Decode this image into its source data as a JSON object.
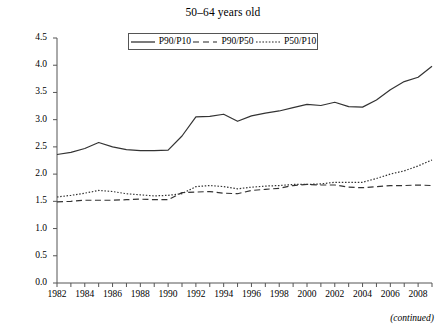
{
  "chart_data": {
    "type": "line",
    "title": "50–64 years old",
    "xlabel": "",
    "ylabel": "",
    "xlim": [
      1982,
      2009
    ],
    "ylim": [
      0.0,
      4.5
    ],
    "grid": false,
    "legend_position": "top-center",
    "y_ticks": [
      "0.0",
      "0.5",
      "1.0",
      "1.5",
      "2.0",
      "2.5",
      "3.0",
      "3.5",
      "4.0",
      "4.5"
    ],
    "x_ticks": [
      "1982",
      "1984",
      "1986",
      "1988",
      "1990",
      "1992",
      "1994",
      "1996",
      "1998",
      "2000",
      "2002",
      "2004",
      "2006",
      "2008"
    ],
    "x": [
      1982,
      1983,
      1984,
      1985,
      1986,
      1987,
      1988,
      1989,
      1990,
      1991,
      1992,
      1993,
      1994,
      1995,
      1996,
      1997,
      1998,
      1999,
      2000,
      2001,
      2002,
      2003,
      2004,
      2005,
      2006,
      2007,
      2008,
      2009
    ],
    "series": [
      {
        "name": "P90/P10",
        "style": "solid",
        "color": "#333333",
        "values": [
          2.36,
          2.4,
          2.47,
          2.58,
          2.5,
          2.45,
          2.43,
          2.43,
          2.44,
          2.7,
          3.05,
          3.06,
          3.1,
          2.97,
          3.07,
          3.12,
          3.16,
          3.22,
          3.28,
          3.26,
          3.32,
          3.24,
          3.23,
          3.36,
          3.55,
          3.7,
          3.78,
          3.98
        ]
      },
      {
        "name": "P90/P50",
        "style": "dashed",
        "color": "#333333",
        "values": [
          1.49,
          1.5,
          1.52,
          1.52,
          1.52,
          1.53,
          1.54,
          1.53,
          1.53,
          1.66,
          1.67,
          1.68,
          1.65,
          1.64,
          1.7,
          1.72,
          1.74,
          1.79,
          1.81,
          1.8,
          1.8,
          1.76,
          1.75,
          1.77,
          1.79,
          1.79,
          1.8,
          1.79
        ]
      },
      {
        "name": "P50/P10",
        "style": "dotted",
        "color": "#333333",
        "values": [
          1.58,
          1.61,
          1.65,
          1.7,
          1.68,
          1.64,
          1.62,
          1.6,
          1.61,
          1.64,
          1.77,
          1.79,
          1.77,
          1.73,
          1.76,
          1.78,
          1.79,
          1.81,
          1.81,
          1.82,
          1.85,
          1.85,
          1.85,
          1.92,
          2.0,
          2.06,
          2.15,
          2.26
        ]
      }
    ]
  },
  "footer": {
    "continued_label": "(continued)"
  },
  "legend": {
    "entries": [
      {
        "label": "P90/P10"
      },
      {
        "label": "P90/P50"
      },
      {
        "label": "P50/P10"
      }
    ]
  }
}
